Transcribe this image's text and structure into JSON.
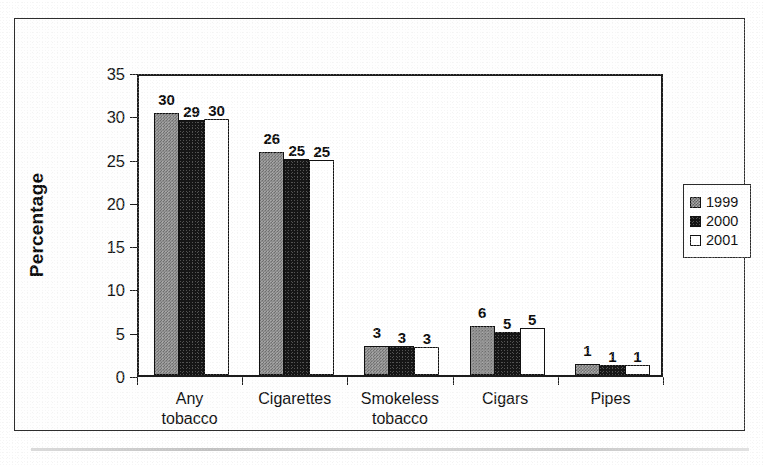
{
  "chart_data": {
    "type": "bar",
    "title": "",
    "xlabel": "",
    "ylabel": "Percentage",
    "ylim": [
      0,
      35
    ],
    "yticks": [
      "0",
      "5",
      "10",
      "15",
      "20",
      "25",
      "30",
      "35"
    ],
    "grid": false,
    "legend_position": "right",
    "categories": [
      "Any tobacco",
      "Cigarettes",
      "Smokeless tobacco",
      "Cigars",
      "Pipes"
    ],
    "category_lines": [
      [
        "Any",
        "tobacco"
      ],
      [
        "Cigarettes"
      ],
      [
        "Smokeless",
        "tobacco"
      ],
      [
        "Cigars"
      ],
      [
        "Pipes"
      ]
    ],
    "series": [
      {
        "name": "1999",
        "color": "#9b9b9b",
        "values": [
          30.3,
          25.8,
          3.4,
          5.7,
          1.3
        ],
        "labels": [
          "30",
          "26",
          "3",
          "6",
          "1"
        ]
      },
      {
        "name": "2000",
        "color": "#161616",
        "values": [
          29.4,
          24.9,
          3.4,
          5.0,
          1.1
        ],
        "labels": [
          "29",
          "25",
          "3",
          "5",
          "1"
        ]
      },
      {
        "name": "2001",
        "color": "#ffffff",
        "values": [
          29.6,
          24.8,
          3.2,
          5.4,
          1.1
        ],
        "labels": [
          "30",
          "25",
          "3",
          "5",
          "1"
        ]
      }
    ]
  },
  "legend": {
    "items": [
      {
        "label": "1999",
        "swatch": "swatch-1999"
      },
      {
        "label": "2000",
        "swatch": "swatch-2000"
      },
      {
        "label": "2001",
        "swatch": "swatch-2001"
      }
    ]
  },
  "axis": {
    "y_title": "Percentage"
  }
}
